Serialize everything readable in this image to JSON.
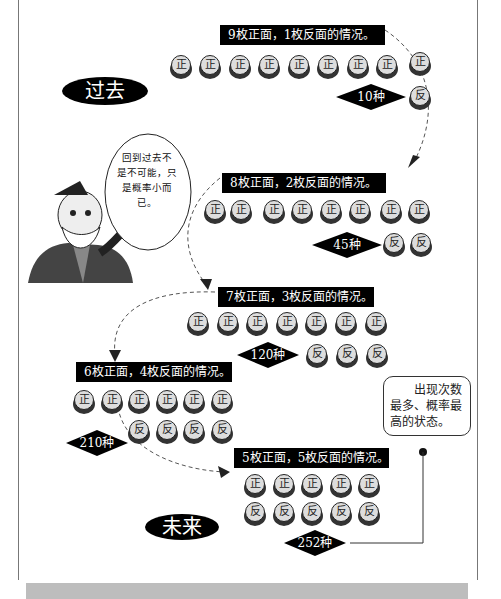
{
  "eras": {
    "past": "过去",
    "future": "未来"
  },
  "speech_bubble": {
    "text": "回到过去不是不可能，只是概率小而已。",
    "lines": [
      "回到过去不",
      "是不可能，只",
      "是概率小而已。"
    ]
  },
  "note": {
    "text": "出现次数最多、概率最高的状态。",
    "lines": [
      "　　出现次数",
      "最多、概率最",
      "高的状态。"
    ]
  },
  "coin_labels": {
    "heads": "正",
    "tails": "反"
  },
  "states": [
    {
      "heads": 9,
      "tails": 1,
      "label": "9枚正面，1枚反面的情况。",
      "count": "10种"
    },
    {
      "heads": 8,
      "tails": 2,
      "label": "8枚正面，2枚反面的情况。",
      "count": "45种"
    },
    {
      "heads": 7,
      "tails": 3,
      "label": "7枚正面，3枚反面的情况。",
      "count": "120种"
    },
    {
      "heads": 6,
      "tails": 4,
      "label": "6枚正面，4枚反面的情况。",
      "count": "210种"
    },
    {
      "heads": 5,
      "tails": 5,
      "label": "5枚正面，5枚反面的情况。",
      "count": "252种"
    }
  ],
  "colors": {
    "label_bg": "#000000",
    "coin_face": "#dddddd",
    "coin_rim": "#333333",
    "frame": "#777777",
    "bottom_bar": "#bdbdbd"
  }
}
